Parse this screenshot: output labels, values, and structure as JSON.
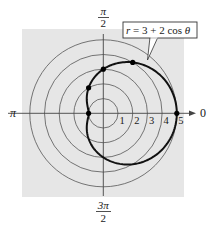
{
  "chart_data": {
    "type": "line",
    "coordinate_system": "polar",
    "title": "",
    "equation_label": "r = 3 + 2 cos θ",
    "equation": {
      "r_prefix": "r",
      "eq": " = 3 + 2 cos ",
      "theta": "θ"
    },
    "xlabel": "",
    "ylabel": "",
    "rlim": [
      0,
      5
    ],
    "radial_ticks": [
      "1",
      "2",
      "3",
      "4",
      "5"
    ],
    "angle_labels": {
      "zero": "0",
      "pi_over_2": {
        "num": "π",
        "den": "2"
      },
      "pi": "π",
      "three_pi_over_2": {
        "num": "3π",
        "den": "2"
      }
    },
    "grid": true,
    "series": [
      {
        "name": "r = 3 + 2 cos θ",
        "function": "r = 3 + 2*cos(theta)",
        "theta_range": [
          0,
          6.283
        ],
        "color": "#111111"
      }
    ],
    "points": [
      {
        "theta": "0",
        "r": 5
      },
      {
        "theta": "π/3",
        "r": 4
      },
      {
        "theta": "π/2",
        "r": 3
      },
      {
        "theta": "2π/3",
        "r": 2
      },
      {
        "theta": "π",
        "r": 1
      }
    ],
    "colors": {
      "background_panel": "#e6e6e6",
      "grid_circles": "#555555",
      "axes": "#444444",
      "curve": "#111111"
    }
  }
}
